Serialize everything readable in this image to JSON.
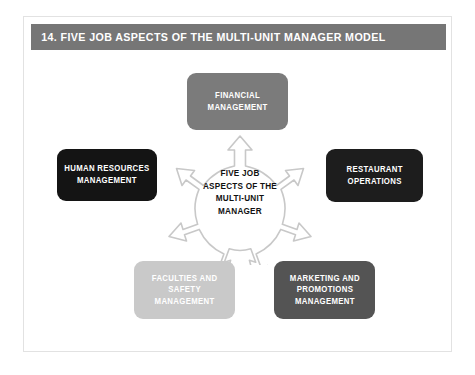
{
  "header": {
    "title": "14. FIVE JOB ASPECTS OF THE MULTI-UNIT MANAGER MODEL",
    "band_color": "#767676",
    "text_color": "#ffffff"
  },
  "card": {
    "background": "#ffffff",
    "border_color": "#e2e2e2"
  },
  "diagram": {
    "type": "hub-and-spoke",
    "hub": {
      "label": "FIVE JOB\nASPECTS OF THE\nMULTI-UNIT\nMANAGER",
      "shape": "five-pointed-arrow-star",
      "outline_color": "#c8c8c8",
      "fill_color": "#ffffff",
      "text_color": "#111111",
      "arrow_count": 5
    },
    "nodes": [
      {
        "id": "financial",
        "label": "FINANCIAL\nMANAGEMENT",
        "position": "top",
        "fill_color": "#7b7b7b",
        "text_color": "#ffffff"
      },
      {
        "id": "human-resources",
        "label": "HUMAN RESOURCES\nMANAGEMENT",
        "position": "left",
        "fill_color": "#141414",
        "text_color": "#ffffff"
      },
      {
        "id": "restaurant-operations",
        "label": "RESTAURANT\nOPERATIONS",
        "position": "right",
        "fill_color": "#1d1d1d",
        "text_color": "#ffffff"
      },
      {
        "id": "facilities-safety",
        "label": "FACULTIES AND\nSAFETY\nMANAGEMENT",
        "position": "bottom-left",
        "fill_color": "#c9c9c9",
        "text_color": "#ffffff"
      },
      {
        "id": "marketing-promotions",
        "label": "MARKETING AND\nPROMOTIONS\nMANAGEMENT",
        "position": "bottom-right",
        "fill_color": "#545454",
        "text_color": "#ffffff"
      }
    ]
  }
}
